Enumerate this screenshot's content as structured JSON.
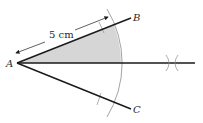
{
  "diagram": {
    "type": "geometric-construction",
    "points": {
      "A": {
        "label": "A",
        "x": 17,
        "y": 63
      },
      "B": {
        "label": "B",
        "x": 131,
        "y": 18
      },
      "C": {
        "label": "C",
        "x": 131,
        "y": 109
      },
      "bisector_end": {
        "x": 195,
        "y": 63
      }
    },
    "labels": {
      "A": "A",
      "B": "B",
      "C": "C",
      "dimension": "5 cm"
    },
    "colors": {
      "line": "#1a1a1a",
      "arc": "#8c8c8c",
      "shade": "#d6d6d6",
      "text": "#2a2a2a"
    },
    "arc_radius": 104
  }
}
